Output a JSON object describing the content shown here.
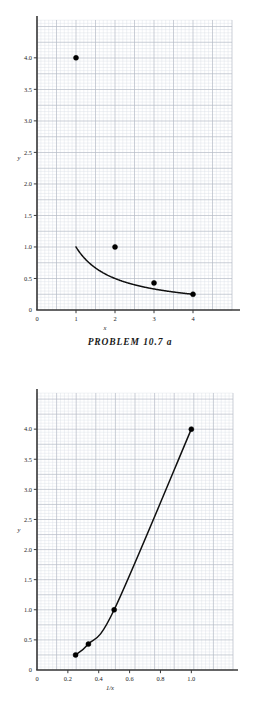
{
  "figures": [
    {
      "id": "problem-10-7-a-top",
      "caption": "PROBLEM  10.7  a",
      "chart_data": {
        "type": "line",
        "title": "",
        "subtitle": "",
        "xlabel": "x",
        "ylabel": "y",
        "xlim": [
          0,
          5.0
        ],
        "ylim": [
          0,
          4.6
        ],
        "xticks": [
          0,
          1,
          2,
          3,
          4
        ],
        "xticklabels": [
          "0",
          "1",
          "2",
          "3",
          "4"
        ],
        "yticks": [
          0,
          0.5,
          1.0,
          1.5,
          2.0,
          2.5,
          3.0,
          3.5,
          4.0
        ],
        "yticklabels": [
          "0",
          "0.5",
          "1.0",
          "1.5",
          "2.0",
          "2.5",
          "3.0",
          "3.5",
          "4.0"
        ],
        "grid": true,
        "grid_style": "graph-paper",
        "legend": false,
        "legend_position": "none",
        "series": [
          {
            "name": "y = 1/x",
            "marker": "filled-circle",
            "line": "solid",
            "x": [
              1,
              2,
              3,
              4
            ],
            "y": [
              4.0,
              1.0,
              0.43,
              0.25
            ]
          }
        ],
        "annotations": []
      }
    },
    {
      "id": "problem-10-7-a-bottom",
      "caption": "",
      "chart_data": {
        "type": "line",
        "title": "",
        "subtitle": "",
        "xlabel": "1/x",
        "ylabel": "y",
        "xlim": [
          0,
          1.27
        ],
        "ylim": [
          0,
          4.6
        ],
        "xticks": [
          0,
          0.2,
          0.4,
          0.6,
          0.8,
          1.0
        ],
        "xticklabels": [
          "0",
          "0.2",
          "0.4",
          "0.6",
          "0.8",
          "1.0"
        ],
        "yticks": [
          0,
          0.5,
          1.0,
          1.5,
          2.0,
          2.5,
          3.0,
          3.5,
          4.0
        ],
        "yticklabels": [
          "0",
          "0.5",
          "1.0",
          "1.5",
          "2.0",
          "2.5",
          "3.0",
          "3.5",
          "4.0"
        ],
        "grid": true,
        "grid_style": "graph-paper",
        "legend": false,
        "legend_position": "none",
        "series": [
          {
            "name": "y vs 1/x",
            "marker": "filled-circle",
            "line": "solid",
            "x": [
              0.25,
              0.333,
              0.5,
              1.0
            ],
            "y": [
              0.25,
              0.43,
              1.0,
              4.0
            ]
          }
        ],
        "annotations": []
      }
    }
  ],
  "colors": {
    "background": "#ffffff",
    "axis": "#3a3a3a",
    "curve": "#101010",
    "marker": "#000000",
    "grid_minor": "#d9dde6",
    "grid_major": "#b4bac6",
    "tick_label": "#1c1c1c"
  }
}
